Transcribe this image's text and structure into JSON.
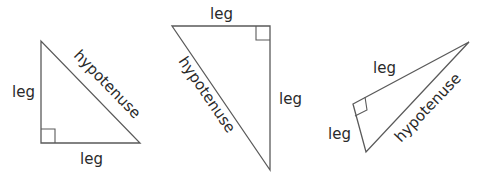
{
  "diagram": {
    "title": "",
    "stroke_color": "#5a5a5a",
    "label_color": "#2a2a2a",
    "triangles": [
      {
        "id": "triangle-1",
        "labels": {
          "vertical_leg": "leg",
          "horizontal_leg": "leg",
          "hypotenuse": "hypotenuse"
        },
        "right_angle": "bottom-left"
      },
      {
        "id": "triangle-2",
        "labels": {
          "top_leg": "leg",
          "vertical_leg": "leg",
          "hypotenuse": "hypotenuse"
        },
        "right_angle": "top-right"
      },
      {
        "id": "triangle-3",
        "labels": {
          "long_leg": "leg",
          "short_leg": "leg",
          "hypotenuse": "hypotenuse"
        },
        "right_angle": "left"
      }
    ]
  }
}
